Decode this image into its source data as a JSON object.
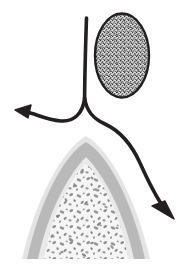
{
  "figure": {
    "width": 187,
    "height": 271,
    "background_color": "#ffffff",
    "title": "",
    "caption": ""
  },
  "colors": {
    "stroke_dark": "#231f20",
    "egg_fill": "#d8d8d8",
    "egg_speckle": "#3a3a3a",
    "dome_outer_band": "#e3e3e3",
    "dome_mid_band": "#b9b9b9",
    "dome_inner_rim": "#e8e8e8",
    "dome_core_fill": "#f4f4f4",
    "dome_core_speckle": "#8b8b8b",
    "white": "#ffffff"
  },
  "elements": {
    "ovoid_body": {
      "name": "speckled ovoid body",
      "center_x": 122,
      "center_y": 55,
      "radius_x": 28,
      "radius_y": 43,
      "fill": "#d8d8d8",
      "stroke": "#231f20",
      "stroke_width": 2,
      "texture": "fine dark stipple"
    },
    "stem_line": {
      "name": "vertical stem",
      "start_x": 86,
      "start_y": 18,
      "end_x": 84,
      "end_y": 100,
      "stroke": "#231f20",
      "stroke_width": 3
    },
    "arrow_left": {
      "name": "left branch arrow",
      "direction": "left",
      "tip_x": 18,
      "tip_y": 112,
      "stroke": "#231f20",
      "stroke_width": 4
    },
    "arrow_right": {
      "name": "right branch arrow",
      "direction": "down-right",
      "tip_x": 172,
      "tip_y": 216,
      "stroke": "#231f20",
      "stroke_width": 4
    },
    "dome_structure": {
      "name": "layered dome cross-section",
      "apex_x": 86,
      "apex_y": 136,
      "left_x": 18,
      "right_x": 156,
      "base_y": 259,
      "layers": [
        "outer band",
        "mid gray band",
        "inner rim",
        "speckled core"
      ]
    }
  },
  "labels": []
}
